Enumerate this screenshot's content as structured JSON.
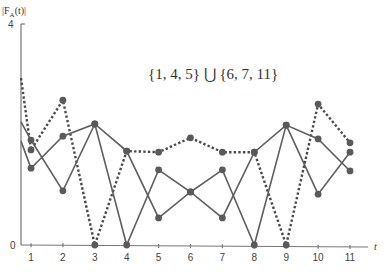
{
  "chart_data": {
    "type": "line",
    "title": "",
    "annotation": "{1, 4, 5} ⋃ {6, 7, 11}",
    "xlabel": "t",
    "ylabel": "|F_A(t)|",
    "ylim": [
      0,
      4
    ],
    "xlim": [
      0.7,
      11.5
    ],
    "yticks": [
      "0",
      "4"
    ],
    "xticks": [
      "1",
      "2",
      "3",
      "4",
      "5",
      "6",
      "7",
      "8",
      "9",
      "10",
      "11"
    ],
    "grid": false,
    "legend": null,
    "x": [
      0.7,
      1,
      2,
      3,
      4,
      5,
      6,
      7,
      8,
      9,
      10,
      11
    ],
    "series": [
      {
        "name": "dotted",
        "style": "dotted",
        "values": [
          3.02,
          1.72,
          2.62,
          0,
          1.7,
          1.68,
          1.94,
          1.68,
          1.68,
          0,
          2.55,
          1.85
        ]
      },
      {
        "name": "solid-a",
        "style": "solid",
        "values": [
          2.23,
          1.9,
          0.98,
          2.19,
          0,
          1.36,
          0.96,
          1.36,
          0,
          2.17,
          0.92,
          1.68
        ]
      },
      {
        "name": "solid-b",
        "style": "solid",
        "values": [
          1.88,
          1.39,
          1.97,
          2.19,
          1.7,
          0.49,
          0.96,
          0.49,
          1.68,
          2.17,
          1.92,
          1.34
        ]
      }
    ],
    "colors": {
      "line": "#5f5f5f",
      "marker": "#5a5a5a",
      "axis": "#777777"
    }
  },
  "labels": {
    "ylabel_text": "|F",
    "ylabel_sub": "A",
    "ylabel_tail": "(t)|",
    "xlabel_text": "t",
    "annotation": "{1, 4, 5} ⋃ {6, 7, 11}",
    "y_top": "4",
    "y_zero": "0"
  }
}
